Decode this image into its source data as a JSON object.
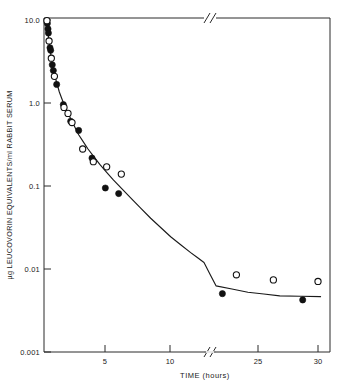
{
  "chart_data": {
    "type": "scatter",
    "title": "",
    "xlabel": "TIME (hours)",
    "ylabel": "µg LEUCOVORIN EQUIVALENTS/ml RABBIT SERUM",
    "yscale": "log",
    "ylim": [
      0.001,
      10.0
    ],
    "ytick_labels": [
      "10.0",
      "1.0",
      "0.1",
      "0.01",
      "0.001"
    ],
    "ytick_values": [
      10.0,
      1.0,
      0.1,
      0.01,
      0.001
    ],
    "xtick_labels": [
      "5",
      "10",
      "25",
      "30"
    ],
    "xtick_values": [
      5,
      10,
      25,
      30
    ],
    "xlim": [
      0,
      31
    ],
    "axis_break": {
      "present": true,
      "after": 12,
      "before": 22,
      "note": "//"
    },
    "grid": false,
    "legend": null,
    "series": [
      {
        "name": "filled-circles",
        "marker": "filled-circle",
        "points": [
          {
            "x": 0.25,
            "y": 8.6
          },
          {
            "x": 0.3,
            "y": 7.4
          },
          {
            "x": 0.33,
            "y": 6.6
          },
          {
            "x": 0.45,
            "y": 4.4
          },
          {
            "x": 0.5,
            "y": 4.1
          },
          {
            "x": 0.62,
            "y": 2.75
          },
          {
            "x": 0.7,
            "y": 2.35
          },
          {
            "x": 0.95,
            "y": 1.6
          },
          {
            "x": 1.45,
            "y": 0.92
          },
          {
            "x": 2.0,
            "y": 0.58
          },
          {
            "x": 2.6,
            "y": 0.45
          },
          {
            "x": 3.6,
            "y": 0.21
          },
          {
            "x": 4.6,
            "y": 0.092
          },
          {
            "x": 5.6,
            "y": 0.079
          },
          {
            "x": 22.5,
            "y": 0.005
          },
          {
            "x": 28.8,
            "y": 0.0042
          }
        ]
      },
      {
        "name": "open-circles",
        "marker": "open-circle",
        "points": [
          {
            "x": 0.22,
            "y": 9.3
          },
          {
            "x": 0.38,
            "y": 5.3
          },
          {
            "x": 0.55,
            "y": 3.3
          },
          {
            "x": 0.78,
            "y": 2.0
          },
          {
            "x": 1.5,
            "y": 0.85
          },
          {
            "x": 1.8,
            "y": 0.72
          },
          {
            "x": 2.1,
            "y": 0.56
          },
          {
            "x": 2.9,
            "y": 0.27
          },
          {
            "x": 3.7,
            "y": 0.19
          },
          {
            "x": 4.7,
            "y": 0.165
          },
          {
            "x": 5.8,
            "y": 0.135
          },
          {
            "x": 23.6,
            "y": 0.0084
          },
          {
            "x": 26.5,
            "y": 0.0073
          },
          {
            "x": 30.0,
            "y": 0.007
          }
        ]
      }
    ],
    "fitted_curve": [
      {
        "x": 0.22,
        "y": 9.6
      },
      {
        "x": 0.35,
        "y": 5.6
      },
      {
        "x": 0.55,
        "y": 3.3
      },
      {
        "x": 0.8,
        "y": 2.05
      },
      {
        "x": 1.15,
        "y": 1.3
      },
      {
        "x": 1.5,
        "y": 0.92
      },
      {
        "x": 2.0,
        "y": 0.62
      },
      {
        "x": 2.6,
        "y": 0.4
      },
      {
        "x": 3.3,
        "y": 0.27
      },
      {
        "x": 4.2,
        "y": 0.175
      },
      {
        "x": 5.2,
        "y": 0.115
      },
      {
        "x": 6.5,
        "y": 0.07
      },
      {
        "x": 8.0,
        "y": 0.04
      },
      {
        "x": 9.5,
        "y": 0.024
      },
      {
        "x": 11.0,
        "y": 0.0155
      },
      {
        "x": 12.0,
        "y": 0.0118
      },
      {
        "x": 22.0,
        "y": 0.0062
      },
      {
        "x": 24.5,
        "y": 0.0052
      },
      {
        "x": 27.0,
        "y": 0.0047
      },
      {
        "x": 30.2,
        "y": 0.0046
      }
    ]
  }
}
